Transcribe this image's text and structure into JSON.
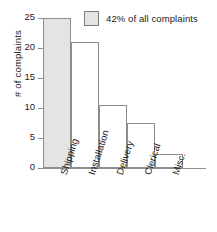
{
  "chart_data": {
    "type": "bar",
    "title": "",
    "subtitle": "",
    "xlabel": "",
    "ylabel": "# of complaints",
    "categories": [
      "Shipping",
      "Installation",
      "Delivery",
      "Clerical",
      "Misc."
    ],
    "values": [
      25,
      21,
      10.5,
      7.5,
      2.3
    ],
    "ylim": [
      0,
      25
    ],
    "yticks": [
      0,
      5,
      10,
      15,
      20,
      25
    ],
    "ytick_labels": [
      "0",
      "5",
      "10",
      "15",
      "20",
      "25"
    ],
    "grid": false,
    "legend_position": "top-right",
    "annotations": [
      {
        "text": "42% of all complaints",
        "refers_to": "Shipping"
      }
    ],
    "series": [
      {
        "name": "# of complaints",
        "values": [
          25,
          21,
          10.5,
          7.5,
          2.3
        ]
      }
    ],
    "highlighted_category": "Shipping",
    "bar_gap": 0
  },
  "legend": {
    "label": "42% of all complaints",
    "swatch_name": "legend-swatch"
  },
  "colors": {
    "highlight_fill": "#e4e4e4",
    "bar_fill": "#ffffff",
    "bar_stroke": "#8d8d8d",
    "axis": "#8d8d8d",
    "text": "#1a1a1a",
    "background": "#ffffff"
  }
}
